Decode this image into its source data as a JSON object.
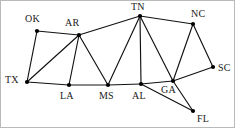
{
  "figure": {
    "name": "state-adjacency-graph",
    "background_color": "#ffffff",
    "border_color": "#b9b9b9",
    "node_color": "#000000",
    "edge_color": "#111111"
  },
  "chart_data": {
    "type": "scatter",
    "title": "",
    "xlabel": "",
    "ylabel": "",
    "grid": false,
    "legend": null,
    "xlim": [
      0,
      235
    ],
    "ylim": [
      0,
      128
    ],
    "nodes": [
      {
        "id": "OK",
        "label": "OK",
        "x": 36,
        "y": 30,
        "label_x": 24,
        "label_y": 13
      },
      {
        "id": "AR",
        "label": "AR",
        "x": 78,
        "y": 34,
        "label_x": 64,
        "label_y": 17
      },
      {
        "id": "TN",
        "label": "TN",
        "x": 139,
        "y": 15,
        "label_x": 130,
        "label_y": 1
      },
      {
        "id": "NC",
        "label": "NC",
        "x": 192,
        "y": 23,
        "label_x": 190,
        "label_y": 8
      },
      {
        "id": "TX",
        "label": "TX",
        "x": 26,
        "y": 81,
        "label_x": 4,
        "label_y": 74
      },
      {
        "id": "LA",
        "label": "LA",
        "x": 68,
        "y": 84,
        "label_x": 59,
        "label_y": 90
      },
      {
        "id": "MS",
        "label": "MS",
        "x": 107,
        "y": 84,
        "label_x": 98,
        "label_y": 90
      },
      {
        "id": "AL",
        "label": "AL",
        "x": 140,
        "y": 83,
        "label_x": 131,
        "label_y": 90
      },
      {
        "id": "GA",
        "label": "GA",
        "x": 172,
        "y": 80,
        "label_x": 160,
        "label_y": 84
      },
      {
        "id": "SC",
        "label": "SC",
        "x": 212,
        "y": 66,
        "label_x": 217,
        "label_y": 62
      },
      {
        "id": "FL",
        "label": "FL",
        "x": 192,
        "y": 110,
        "label_x": 196,
        "label_y": 113
      }
    ],
    "edges": [
      {
        "from": "OK",
        "to": "AR"
      },
      {
        "from": "OK",
        "to": "TX"
      },
      {
        "from": "AR",
        "to": "TX"
      },
      {
        "from": "AR",
        "to": "LA"
      },
      {
        "from": "AR",
        "to": "MS"
      },
      {
        "from": "AR",
        "to": "TN"
      },
      {
        "from": "TX",
        "to": "LA"
      },
      {
        "from": "LA",
        "to": "MS"
      },
      {
        "from": "MS",
        "to": "TN"
      },
      {
        "from": "MS",
        "to": "AL"
      },
      {
        "from": "TN",
        "to": "AL"
      },
      {
        "from": "TN",
        "to": "GA"
      },
      {
        "from": "TN",
        "to": "NC"
      },
      {
        "from": "NC",
        "to": "GA"
      },
      {
        "from": "NC",
        "to": "SC"
      },
      {
        "from": "SC",
        "to": "GA"
      },
      {
        "from": "AL",
        "to": "GA"
      },
      {
        "from": "AL",
        "to": "FL"
      },
      {
        "from": "GA",
        "to": "FL"
      }
    ]
  }
}
